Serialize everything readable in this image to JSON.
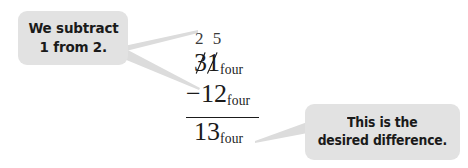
{
  "page": {
    "background_color": "#ffffff",
    "callout_fill_color": "#e2e2e2",
    "ink_color": "#1b1b1b"
  },
  "callouts": {
    "left": {
      "line1": "We subtract",
      "line2_prefix": "1 from ",
      "line2_emphasis": "2."
    },
    "right": {
      "line1": "This is the",
      "line2": "desired difference."
    }
  },
  "math": {
    "borrow_digits": "2 5",
    "minuend": {
      "digits": "31",
      "base": "four",
      "crossed_out": true
    },
    "subtrahend": {
      "operator": "−",
      "digits": "12",
      "base": "four"
    },
    "difference": {
      "digits": "13",
      "base": "four"
    }
  }
}
